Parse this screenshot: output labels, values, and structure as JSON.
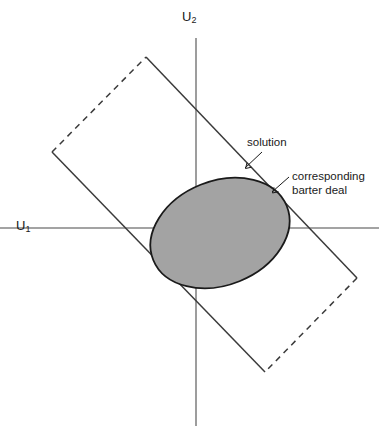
{
  "figure": {
    "title_present": false,
    "axes": {
      "y_label": "U",
      "y_label_sub": "2",
      "x_label": "U",
      "x_label_sub": "1"
    },
    "annotations": {
      "solution": "solution",
      "barter_line1": "corresponding",
      "barter_line2": "barter deal"
    },
    "colors": {
      "region_fill": "#a3a3a3",
      "region_stroke": "#1a1a1a",
      "axis_stroke": "#808080",
      "rect_stroke": "#3a3a3a",
      "text": "#1a1a1a",
      "background": "#ffffff"
    }
  },
  "chart_data": {
    "type": "diagram",
    "xlabel": "U1",
    "ylabel": "U2",
    "origin": {
      "x": 196,
      "y": 228
    },
    "axis_x": {
      "x1": 0,
      "y1": 228,
      "x2": 379,
      "y2": 228
    },
    "axis_y": {
      "x1": 196,
      "y1": 38,
      "x2": 196,
      "y2": 426
    },
    "region_ellipse": {
      "cx": 220,
      "cy": 233,
      "rx": 72,
      "ry": 52,
      "rotation_deg": -22,
      "fill": "#a3a3a3",
      "stroke": "#1a1a1a"
    },
    "rectangle": {
      "corners": [
        {
          "name": "top",
          "x": 146,
          "y": 57
        },
        {
          "name": "right",
          "x": 357,
          "y": 278
        },
        {
          "name": "bottom",
          "x": 265,
          "y": 372
        },
        {
          "name": "left",
          "x": 52,
          "y": 152
        }
      ],
      "edges": [
        {
          "from": "top",
          "to": "right",
          "style": "solid"
        },
        {
          "from": "right",
          "to": "bottom",
          "style": "dashed"
        },
        {
          "from": "bottom",
          "to": "left",
          "style": "solid"
        },
        {
          "from": "left",
          "to": "top",
          "style": "dashed"
        }
      ]
    },
    "leaders": [
      {
        "label": "solution",
        "from": {
          "x": 262,
          "y": 152
        },
        "to": {
          "x": 245,
          "y": 168
        }
      },
      {
        "label": "corresponding barter deal",
        "from": {
          "x": 289,
          "y": 177
        },
        "to": {
          "x": 272,
          "y": 192
        }
      }
    ],
    "tangency_point": {
      "x": 272,
      "y": 192
    },
    "legend": null,
    "grid": false
  }
}
